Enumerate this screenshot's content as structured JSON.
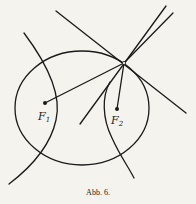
{
  "figure": {
    "caption": "Abb. 6.",
    "labels": {
      "f1_main": "F",
      "f1_sub": "1",
      "f2_main": "F",
      "f2_sub": "2"
    },
    "colors": {
      "stroke": "#1a1a1a",
      "background": "#f4f3ee"
    }
  }
}
